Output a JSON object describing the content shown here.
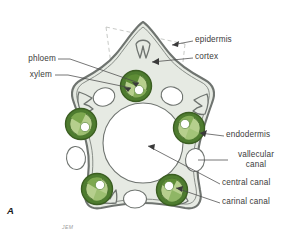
{
  "figure": {
    "panel_letter": "A",
    "signature": "JEM",
    "caption_subject": "Equisetum stem cross section"
  },
  "colors": {
    "background": "#ffffff",
    "epidermis_line": "#6f7470",
    "cortex_fill": "#e9ece7",
    "cortex_inner_fill": "#eef0ec",
    "endodermis_ring": "#4e7c2f",
    "endodermis_ring_dark": "#3f6a26",
    "xylem_fill": "#a8c47e",
    "phloem_fill": "#5d8c35",
    "canal_white": "#ffffff",
    "outline": "#555a56",
    "dashed_guide": "#b9bbb7",
    "leader_line": "#4a4a4a",
    "label_text": "#3b3b3b"
  },
  "labels": [
    {
      "id": "epidermis",
      "text": "epidermis",
      "side": "right",
      "x": 195,
      "y": 39
    },
    {
      "id": "cortex",
      "text": "cortex",
      "side": "right",
      "x": 195,
      "y": 56
    },
    {
      "id": "phloem",
      "text": "phloem",
      "side": "left",
      "x": 12,
      "y": 58
    },
    {
      "id": "xylem",
      "text": "xylem",
      "side": "left",
      "x": 18,
      "y": 74
    },
    {
      "id": "endodermis",
      "text": "endodermis",
      "side": "right",
      "x": 226,
      "y": 134
    },
    {
      "id": "vallecular-canal",
      "text": "vallecular",
      "text2": "canal",
      "side": "right",
      "x": 230,
      "y": 156
    },
    {
      "id": "central-canal",
      "text": "central canal",
      "side": "right",
      "x": 222,
      "y": 182
    },
    {
      "id": "carinal-canal",
      "text": "carinal canal",
      "side": "right",
      "x": 222,
      "y": 201
    }
  ],
  "structures": {
    "central_canal": {
      "cx": 143,
      "cy": 143,
      "r": 40,
      "name": "central canal"
    },
    "vascular_bundles": [
      {
        "id": "bundle-top",
        "cx": 136,
        "cy": 86,
        "r": 15.5,
        "rotation": 0
      },
      {
        "id": "bundle-left",
        "cx": 81,
        "cy": 124,
        "r": 15.5,
        "rotation": 288
      },
      {
        "id": "bundle-right",
        "cx": 189,
        "cy": 128,
        "r": 15.5,
        "rotation": 72
      },
      {
        "id": "bundle-bottom-left",
        "cx": 97,
        "cy": 189,
        "r": 15.5,
        "rotation": 216
      },
      {
        "id": "bundle-bottom-right",
        "cx": 172,
        "cy": 190,
        "r": 15.5,
        "rotation": 144
      }
    ],
    "vallecular_canals": [
      {
        "id": "vallecular-top-left",
        "cx": 104,
        "cy": 97,
        "rx": 11,
        "ry": 9
      },
      {
        "id": "vallecular-top-right",
        "cx": 171,
        "cy": 96,
        "rx": 11,
        "ry": 9
      },
      {
        "id": "vallecular-left",
        "cx": 76,
        "cy": 158,
        "rx": 10,
        "ry": 11
      },
      {
        "id": "vallecular-right",
        "cx": 194,
        "cy": 160,
        "rx": 10,
        "ry": 11
      },
      {
        "id": "vallecular-bottom-center",
        "cx": 135,
        "cy": 199,
        "rx": 11,
        "ry": 9
      }
    ],
    "counts": {
      "vascular_bundles": 5,
      "vallecular_canals": 5,
      "carinal_canals": 5
    }
  }
}
